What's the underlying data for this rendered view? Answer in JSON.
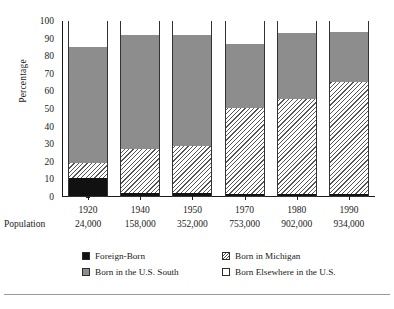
{
  "chart_data": {
    "type": "bar",
    "subtype": "stacked-bar-100",
    "title": "",
    "xlabel": "",
    "ylabel": "Percentage",
    "ylim": [
      0,
      100
    ],
    "yticks": [
      0,
      10,
      20,
      30,
      40,
      50,
      60,
      70,
      80,
      90,
      100
    ],
    "grid": false,
    "legend_position": "bottom",
    "categories": [
      "1920",
      "1940",
      "1950",
      "1970",
      "1980",
      "1990"
    ],
    "row_header": "Population",
    "population": [
      "24,000",
      "158,000",
      "352,000",
      "753,000",
      "902,000",
      "934,000"
    ],
    "series": [
      {
        "name": "Foreign-Born",
        "key": "foreign",
        "color": "#111111",
        "pattern": "solid-black",
        "values": [
          10,
          1.5,
          1.5,
          1,
          1,
          1
        ]
      },
      {
        "name": "Born in Michigan",
        "key": "michigan",
        "color": "#ffffff",
        "pattern": "diagonal-hatch",
        "values": [
          9,
          25,
          27,
          49,
          54,
          64
        ]
      },
      {
        "name": "Born in the U.S. South",
        "key": "south",
        "color": "#8d8d8d",
        "pattern": "solid-gray",
        "values": [
          65.5,
          65,
          63,
          36.5,
          37.5,
          28
        ]
      },
      {
        "name": "Born Elsewhere in the U.S.",
        "key": "elsewhere",
        "color": "#ffffff",
        "pattern": "solid-white",
        "values": [
          15.5,
          8.5,
          8.5,
          13.5,
          7.5,
          7
        ]
      }
    ],
    "cumulative_tops": {
      "foreign": [
        10,
        1.5,
        1.5,
        1,
        1,
        1
      ],
      "michigan": [
        19,
        26.5,
        28.5,
        50,
        55,
        65
      ],
      "south": [
        84.5,
        91.5,
        91.5,
        86.5,
        92.5,
        93
      ],
      "elsewhere": [
        100,
        100,
        100,
        100,
        100,
        100
      ]
    }
  },
  "legend": {
    "items": [
      {
        "label": "Foreign-Born",
        "swatch": "sw-foreign"
      },
      {
        "label": "Born in Michigan",
        "swatch": "sw-michigan"
      },
      {
        "label": "Born in the U.S. South",
        "swatch": "sw-south"
      },
      {
        "label": "Born Elsewhere in the U.S.",
        "swatch": "sw-elsewhere"
      }
    ]
  },
  "footer": {
    "text": ""
  }
}
